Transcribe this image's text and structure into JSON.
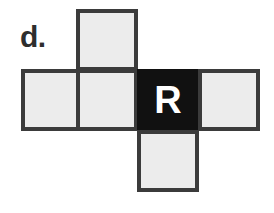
{
  "figure": {
    "label": "d.",
    "background_color": "#ffffff",
    "face_fill_light": "#ececec",
    "face_fill_dark": "#111111",
    "face_border_color": "#3b3b3b",
    "letter_color": "#ffffff",
    "label_color": "#2e2e2e"
  },
  "net": {
    "shape": "cross",
    "rows": 3,
    "columns": 4,
    "face_size_px": 62,
    "faces": [
      {
        "id": "top",
        "row": 1,
        "column": 2,
        "fill": "light",
        "letter": ""
      },
      {
        "id": "middle-1",
        "row": 2,
        "column": 1,
        "fill": "light",
        "letter": ""
      },
      {
        "id": "middle-2",
        "row": 2,
        "column": 2,
        "fill": "light",
        "letter": ""
      },
      {
        "id": "middle-3",
        "row": 2,
        "column": 3,
        "fill": "dark",
        "letter": "R"
      },
      {
        "id": "middle-4",
        "row": 2,
        "column": 4,
        "fill": "light",
        "letter": ""
      },
      {
        "id": "bottom",
        "row": 3,
        "column": 3,
        "fill": "light",
        "letter": ""
      }
    ]
  }
}
